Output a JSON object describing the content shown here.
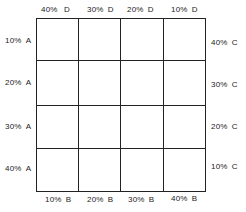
{
  "top_labels": [
    {
      "pct": "40%",
      "letter": "D"
    },
    {
      "pct": "30%",
      "letter": "D"
    },
    {
      "pct": "20%",
      "letter": "D"
    },
    {
      "pct": "10%",
      "letter": "D"
    }
  ],
  "bottom_labels": [
    {
      "pct": "10%",
      "letter": "B"
    },
    {
      "pct": "20%",
      "letter": "B"
    },
    {
      "pct": "30%",
      "letter": "B"
    },
    {
      "pct": "40%",
      "letter": "B"
    }
  ],
  "left_labels": [
    {
      "pct": "10%",
      "letter": "A"
    },
    {
      "pct": "20%",
      "letter": "A"
    },
    {
      "pct": "30%",
      "letter": "A"
    },
    {
      "pct": "40%",
      "letter": "A"
    }
  ],
  "right_labels": [
    {
      "pct": "40%",
      "letter": "C"
    },
    {
      "pct": "30%",
      "letter": "C"
    },
    {
      "pct": "20%",
      "letter": "C"
    },
    {
      "pct": "10%",
      "letter": "C"
    }
  ],
  "grid": {
    "rows": 4,
    "cols": 4
  }
}
